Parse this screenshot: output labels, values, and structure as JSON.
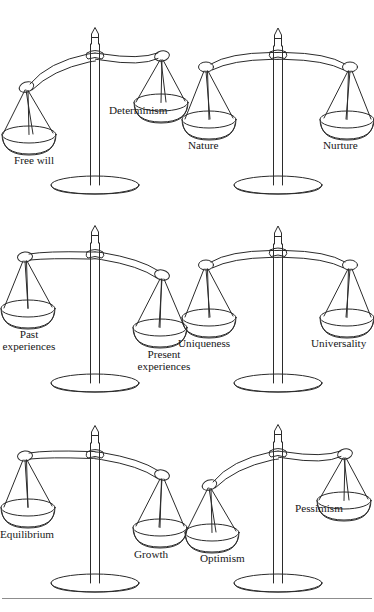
{
  "figure": {
    "kind": "balance-scale-diagram",
    "caption_rule_visible": true,
    "running_head": "",
    "colors": {
      "ink": "#1a1a1a",
      "line": "#2b2b2b",
      "paper": "#ffffff",
      "rule": "#8d8d8d"
    },
    "rows": 3,
    "columns": 2,
    "scale_count": 6
  },
  "scales": [
    {
      "id": "free-will-determinism",
      "row": 1,
      "column": 1,
      "tilt": "left-down",
      "tilt_degrees": -16,
      "left": {
        "label": "Free will",
        "position": "low"
      },
      "right": {
        "label": "Determinism",
        "position": "high"
      }
    },
    {
      "id": "nature-nurture",
      "row": 1,
      "column": 2,
      "tilt": "level",
      "tilt_degrees": 0,
      "left": {
        "label": "Nature",
        "position": "level"
      },
      "right": {
        "label": "Nurture",
        "position": "level"
      }
    },
    {
      "id": "past-present-experiences",
      "row": 2,
      "column": 1,
      "tilt": "left-up",
      "tilt_degrees": 16,
      "left": {
        "label": "Past experiences",
        "position": "high"
      },
      "right": {
        "label": "Present experiences",
        "position": "low"
      }
    },
    {
      "id": "uniqueness-universality",
      "row": 2,
      "column": 2,
      "tilt": "level",
      "tilt_degrees": 0,
      "left": {
        "label": "Uniqueness",
        "position": "level"
      },
      "right": {
        "label": "Universality",
        "position": "level"
      }
    },
    {
      "id": "equilibrium-growth",
      "row": 3,
      "column": 1,
      "tilt": "left-up",
      "tilt_degrees": 16,
      "left": {
        "label": "Equilibrium",
        "position": "high"
      },
      "right": {
        "label": "Growth",
        "position": "low"
      }
    },
    {
      "id": "optimism-pessimism",
      "row": 3,
      "column": 2,
      "tilt": "left-down",
      "tilt_degrees": -16,
      "left": {
        "label": "Optimism",
        "position": "low"
      },
      "right": {
        "label": "Pessimism",
        "position": "high"
      }
    }
  ],
  "labels": {
    "free_will": "Free will",
    "determinism": "Determinism",
    "nature": "Nature",
    "nurture": "Nurture",
    "past_experiences_line1": "Past",
    "past_experiences_line2": "experiences",
    "present_experiences_line1": "Present",
    "present_experiences_line2": "experiences",
    "uniqueness": "Uniqueness",
    "universality": "Universality",
    "equilibrium": "Equilibrium",
    "growth": "Growth",
    "optimism": "Optimism",
    "pessimism": "Pessimism"
  }
}
